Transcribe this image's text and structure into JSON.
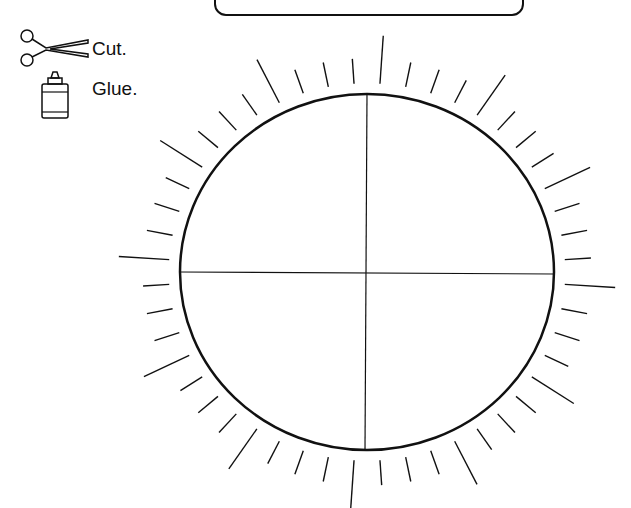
{
  "worksheet": {
    "instructions": [
      {
        "icon": "scissors-icon",
        "label": "Cut."
      },
      {
        "icon": "glue-bottle-icon",
        "label": "Glue."
      }
    ],
    "title_box_text": "",
    "circle": {
      "cx": 367,
      "cy": 272,
      "rx": 187,
      "ry": 178,
      "divisions": 4
    },
    "rays": {
      "count": 48,
      "long_every": 4,
      "stroke": "#111"
    }
  }
}
